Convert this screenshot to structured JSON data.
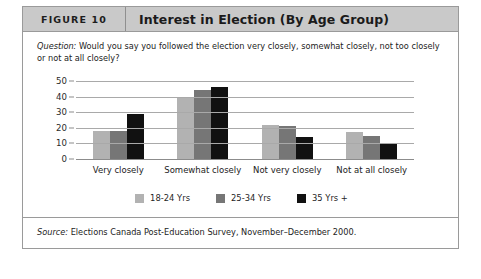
{
  "figure": {
    "number_label": "FIGURE 10",
    "title": "Interest in Election (By Age Group)"
  },
  "question": {
    "label": "Question:",
    "text": " Would you say you followed the election very closely, somewhat closely, not too closely or not at all closely?"
  },
  "source": {
    "label": "Source:",
    "text": " Elections Canada Post-Education Survey, November–December 2000."
  },
  "colors": {
    "series_18_24": "#b2b2b2",
    "series_25_34": "#767676",
    "series_35_plus": "#111111",
    "header_bg": "#c9c9c9",
    "frame_border": "#9a9a9a",
    "gridline": "#a9a9a9"
  },
  "chart_data": {
    "type": "bar",
    "title": "Interest in Election (By Age Group)",
    "xlabel": "",
    "ylabel": "",
    "ylim": [
      0,
      50
    ],
    "yticks": [
      0,
      10,
      20,
      30,
      40,
      50
    ],
    "grid": true,
    "legend_position": "bottom",
    "categories": [
      "Very closely",
      "Somewhat closely",
      "Not very closely",
      "Not at all closely"
    ],
    "series": [
      {
        "name": "18-24 Yrs",
        "color": "#b2b2b2",
        "values": [
          18,
          40,
          22,
          17
        ]
      },
      {
        "name": "25-34 Yrs",
        "color": "#767676",
        "values": [
          18,
          44,
          21,
          15
        ]
      },
      {
        "name": "35 Yrs +",
        "color": "#111111",
        "values": [
          29,
          46,
          14,
          10
        ]
      }
    ]
  }
}
